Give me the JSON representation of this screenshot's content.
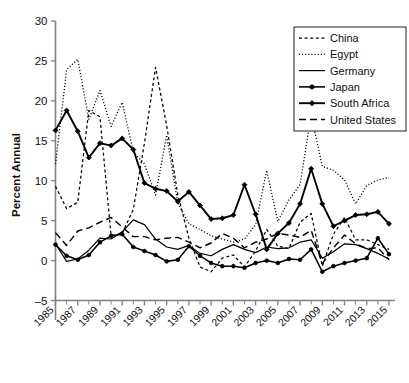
{
  "chart_data": {
    "type": "line",
    "title": "",
    "xlabel": "",
    "ylabel": "Percent Annual",
    "xlim": [
      1985,
      2015
    ],
    "ylim": [
      -5,
      30
    ],
    "yticks": [
      -5,
      0,
      5,
      10,
      15,
      20,
      25,
      30
    ],
    "yticklabels": [
      "–5",
      "0",
      "5",
      "10",
      "15",
      "20",
      "25",
      "30"
    ],
    "xticks": [
      1985,
      1987,
      1989,
      1991,
      1993,
      1995,
      1997,
      1999,
      2001,
      2003,
      2005,
      2007,
      2009,
      2011,
      2013,
      2015
    ],
    "xticklabels": [
      "1985",
      "1987",
      "1989",
      "1991",
      "1993",
      "1995",
      "1997",
      "1999",
      "2001",
      "2003",
      "2005",
      "2007",
      "2009",
      "2011",
      "2013",
      "2015"
    ],
    "minor_xticks_every": 1,
    "grid": false,
    "legend_position": "top-right",
    "x": [
      1985,
      1986,
      1987,
      1988,
      1989,
      1990,
      1991,
      1992,
      1993,
      1994,
      1995,
      1996,
      1997,
      1998,
      1999,
      2000,
      2001,
      2002,
      2003,
      2004,
      2005,
      2006,
      2007,
      2008,
      2009,
      2010,
      2011,
      2012,
      2013,
      2014,
      2015
    ],
    "series": [
      {
        "name": "China",
        "style": "dashed-fine",
        "marker": "none",
        "values": [
          9.3,
          6.5,
          7.3,
          18.8,
          18.0,
          3.1,
          3.4,
          6.4,
          14.7,
          24.2,
          16.9,
          8.3,
          2.8,
          -0.8,
          -1.4,
          0.3,
          0.7,
          -0.8,
          1.2,
          3.9,
          1.8,
          1.5,
          4.8,
          5.9,
          -0.7,
          3.3,
          5.4,
          2.6,
          2.6,
          2.0,
          1.4
        ]
      },
      {
        "name": "Egypt",
        "style": "dotted",
        "marker": "none",
        "values": [
          12.1,
          23.9,
          25.2,
          17.7,
          21.3,
          16.8,
          19.8,
          13.6,
          12.1,
          8.2,
          15.7,
          7.2,
          4.6,
          3.9,
          3.1,
          2.7,
          2.3,
          2.7,
          4.5,
          11.3,
          4.9,
          7.6,
          9.5,
          18.3,
          11.8,
          11.3,
          10.1,
          7.1,
          9.4,
          10.1,
          10.4
        ]
      },
      {
        "name": "Germany",
        "style": "solid-thin",
        "marker": "none",
        "values": [
          2.1,
          -0.1,
          0.2,
          1.3,
          2.8,
          2.7,
          3.6,
          5.1,
          4.5,
          2.7,
          1.7,
          1.4,
          1.9,
          0.9,
          0.6,
          1.4,
          2.0,
          1.4,
          1.0,
          1.7,
          1.5,
          1.6,
          2.3,
          2.6,
          0.3,
          1.1,
          2.1,
          2.0,
          1.5,
          0.9,
          0.2
        ]
      },
      {
        "name": "Japan",
        "style": "solid-round",
        "marker": "circle",
        "values": [
          2.0,
          0.6,
          0.1,
          0.7,
          2.3,
          3.1,
          3.3,
          1.7,
          1.2,
          0.7,
          -0.1,
          0.1,
          1.8,
          0.6,
          -0.3,
          -0.7,
          -0.7,
          -0.9,
          -0.3,
          0.0,
          -0.3,
          0.2,
          0.1,
          1.4,
          -1.4,
          -0.7,
          -0.3,
          0.0,
          0.3,
          2.8,
          0.8
        ]
      },
      {
        "name": "South Africa",
        "style": "solid-diamond",
        "marker": "diamond",
        "values": [
          16.3,
          18.8,
          16.2,
          12.9,
          14.7,
          14.4,
          15.3,
          13.9,
          9.7,
          9.0,
          8.7,
          7.4,
          8.6,
          6.9,
          5.2,
          5.3,
          5.7,
          9.5,
          5.8,
          1.4,
          3.4,
          4.7,
          7.1,
          11.5,
          7.1,
          4.3,
          5.0,
          5.7,
          5.8,
          6.1,
          4.6
        ]
      },
      {
        "name": "United States",
        "style": "dashed-long",
        "marker": "none",
        "values": [
          3.5,
          1.9,
          3.7,
          4.1,
          4.8,
          5.4,
          4.2,
          3.0,
          3.0,
          2.6,
          2.8,
          2.9,
          2.3,
          1.6,
          2.2,
          3.4,
          2.8,
          1.6,
          2.3,
          2.7,
          3.4,
          3.2,
          2.9,
          3.8,
          -0.4,
          1.6,
          3.2,
          2.1,
          1.5,
          1.6,
          0.1
        ]
      }
    ]
  }
}
